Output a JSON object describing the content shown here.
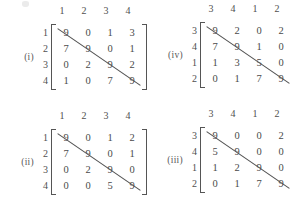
{
  "page": {
    "kind": "matrix-figure-set",
    "background_color": "#ffffff",
    "ink_color": "#4a4a4a",
    "smudge_visible": true
  },
  "matrices": [
    {
      "id": "i",
      "tag": "(i)",
      "col_headers": [
        "1",
        "2",
        "3",
        "4"
      ],
      "row_headers": [
        "1",
        "2",
        "3",
        "4"
      ],
      "rows": [
        [
          "9",
          "0",
          "1",
          "3"
        ],
        [
          "7",
          "9",
          "0",
          "1"
        ],
        [
          "0",
          "2",
          "9",
          "2"
        ],
        [
          "1",
          "0",
          "7",
          "9"
        ]
      ],
      "diagonal_line": true
    },
    {
      "id": "iv",
      "tag": "(iv)",
      "col_headers": [
        "3",
        "4",
        "1",
        "2"
      ],
      "row_headers": [
        "3",
        "4",
        "1",
        "2"
      ],
      "rows": [
        [
          "9",
          "2",
          "0",
          "2"
        ],
        [
          "7",
          "9",
          "1",
          "0"
        ],
        [
          "1",
          "3",
          "5",
          "0"
        ],
        [
          "0",
          "1",
          "7",
          "9"
        ]
      ],
      "diagonal_line": true
    },
    {
      "id": "ii",
      "tag": "(ii)",
      "col_headers": [
        "1",
        "2",
        "3",
        "4"
      ],
      "row_headers": [
        "1",
        "2",
        "3",
        "4"
      ],
      "rows": [
        [
          "9",
          "0",
          "1",
          "2"
        ],
        [
          "7",
          "9",
          "0",
          "1"
        ],
        [
          "0",
          "2",
          "9",
          "0"
        ],
        [
          "0",
          "0",
          "5",
          "9"
        ]
      ],
      "diagonal_line": true
    },
    {
      "id": "iii",
      "tag": "(iii)",
      "col_headers": [
        "3",
        "4",
        "1",
        "2"
      ],
      "row_headers": [
        "3",
        "4",
        "1",
        "2"
      ],
      "rows": [
        [
          "9",
          "0",
          "0",
          "2"
        ],
        [
          "5",
          "9",
          "0",
          "0"
        ],
        [
          "1",
          "2",
          "9",
          "0"
        ],
        [
          "0",
          "1",
          "7",
          "9"
        ]
      ],
      "diagonal_line": true
    }
  ]
}
